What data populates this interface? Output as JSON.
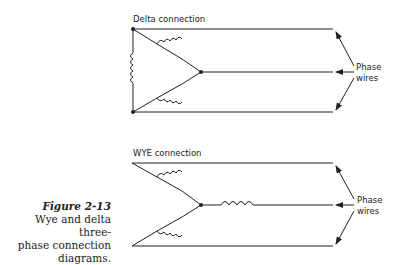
{
  "caption": {
    "figure_label": "Figure 2-13",
    "lines": [
      "Wye and delta three-",
      "phase connection",
      "diagrams."
    ]
  },
  "delta": {
    "title": "Delta connection",
    "phase_label_line1": "Phase",
    "phase_label_line2": "wires"
  },
  "wye": {
    "title": "WYE connection",
    "phase_label_line1": "Phase",
    "phase_label_line2": "wires"
  },
  "colors": {
    "line": "#222222",
    "background": "#ffffff"
  }
}
